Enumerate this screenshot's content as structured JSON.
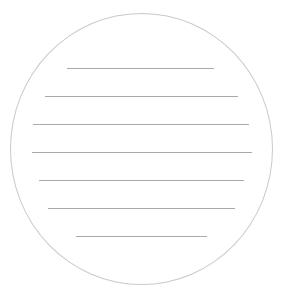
{
  "figure": {
    "shape": "circle",
    "colors": {
      "background": "#ffffff",
      "outline": "#c9c9c9",
      "rule": "#a9a9a9"
    },
    "circle": {
      "left": 10,
      "top": 13,
      "width": 263,
      "height": 272
    },
    "rules": [
      {
        "y": 68,
        "x1": 67,
        "x2": 214
      },
      {
        "y": 96,
        "x1": 45,
        "x2": 238
      },
      {
        "y": 124,
        "x1": 33,
        "x2": 249
      },
      {
        "y": 152,
        "x1": 32,
        "x2": 252
      },
      {
        "y": 180,
        "x1": 39,
        "x2": 244
      },
      {
        "y": 208,
        "x1": 48,
        "x2": 235
      },
      {
        "y": 236,
        "x1": 76,
        "x2": 207
      }
    ]
  }
}
